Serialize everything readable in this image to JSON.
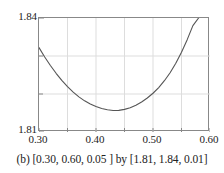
{
  "caption": "(b) [0.30, 0.60, 0.05 ] by [1.81, 1.84, 0.01]",
  "axes": {
    "y_top_label": "1.84",
    "y_bottom_label": "1.81",
    "x_tick_labels": [
      "0.30",
      "0.40",
      "0.50",
      "0.60"
    ]
  },
  "colors": {
    "curve": "#555555",
    "frame": "#888888",
    "grid": "#dddddd",
    "text": "#222222"
  },
  "chart_data": {
    "type": "line",
    "title": "",
    "xlabel": "",
    "ylabel": "",
    "xlim": [
      0.3,
      0.6
    ],
    "ylim": [
      1.81,
      1.84
    ],
    "xtick_step": 0.05,
    "ytick_step": 0.01,
    "xticks": [
      0.3,
      0.35,
      0.4,
      0.45,
      0.5,
      0.55,
      0.6
    ],
    "yticks": [
      1.81,
      1.82,
      1.83,
      1.84
    ],
    "xtick_labels_shown": [
      "0.30",
      "0.40",
      "0.50",
      "0.60"
    ],
    "ytick_labels_shown": [
      "1.81",
      "1.84"
    ],
    "grid": true,
    "legend": "none",
    "series": [
      {
        "name": "curve",
        "x": [
          0.3,
          0.31,
          0.32,
          0.33,
          0.34,
          0.35,
          0.36,
          0.37,
          0.38,
          0.39,
          0.4,
          0.41,
          0.42,
          0.43,
          0.44,
          0.45,
          0.46,
          0.47,
          0.48,
          0.49,
          0.5,
          0.51,
          0.52,
          0.53,
          0.54,
          0.55,
          0.56,
          0.57,
          0.58
        ],
        "y": [
          1.8322,
          1.82975,
          1.8275,
          1.82545,
          1.8236,
          1.82195,
          1.8205,
          1.81925,
          1.8182,
          1.81735,
          1.8167,
          1.8162,
          1.81585,
          1.81565,
          1.8157,
          1.81595,
          1.8164,
          1.81705,
          1.8179,
          1.81895,
          1.8202,
          1.8217,
          1.8235,
          1.8256,
          1.8281,
          1.831,
          1.8343,
          1.838,
          1.84
        ]
      }
    ],
    "minimum": {
      "x": 0.43,
      "y": 1.8156
    }
  }
}
